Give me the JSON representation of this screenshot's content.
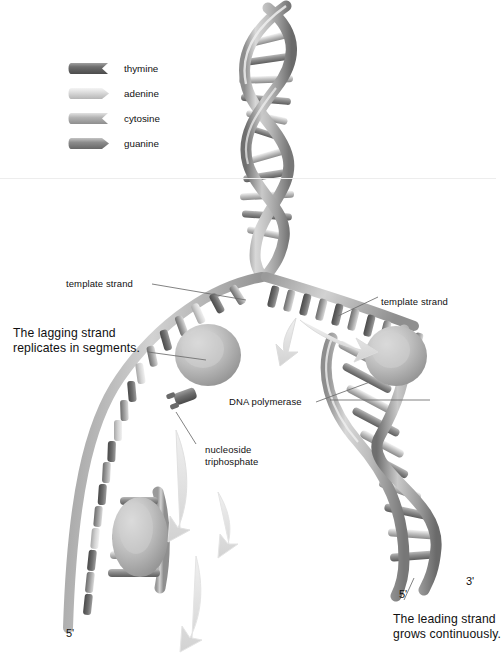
{
  "figure": {
    "background_color": "#ffffff",
    "palette": {
      "thymine": "#6e6e6e",
      "adenine": "#dcdcdc",
      "cytosine": "#b4b4b4",
      "guanine": "#8c8c8c",
      "backbone_light": "#cfcfcf",
      "backbone_mid": "#a8a8a8",
      "backbone_dark": "#7d7d7d",
      "polymerase": "#bdbdbd",
      "arrow": "#e2e2e2",
      "leader_line": "#6b6b6b",
      "text": "#111111"
    }
  },
  "legend": {
    "items": [
      {
        "label": "thymine",
        "color": "#6e6e6e",
        "end_shape": "concave",
        "icon": "nucleotide-cylinder-icon"
      },
      {
        "label": "adenine",
        "color": "#dcdcdc",
        "end_shape": "convex",
        "icon": "nucleotide-cylinder-icon"
      },
      {
        "label": "cytosine",
        "color": "#b4b4b4",
        "end_shape": "concave",
        "icon": "nucleotide-cylinder-icon"
      },
      {
        "label": "guanine",
        "color": "#8c8c8c",
        "end_shape": "convex",
        "icon": "nucleotide-cylinder-icon"
      }
    ]
  },
  "annotations": {
    "template_strand_left": "template strand",
    "template_strand_right": "template strand",
    "lagging_strand": "The lagging strand\nreplicates in segments.",
    "dna_polymerase": "DNA polymerase",
    "nucleoside_triphosphate": "nucleoside\ntriphosphate",
    "leading_strand": "The leading strand\ngrows continuously.",
    "prime_bottom_left": "5'",
    "prime_fork_right_five": "5'",
    "prime_fork_right_three": "3'"
  }
}
